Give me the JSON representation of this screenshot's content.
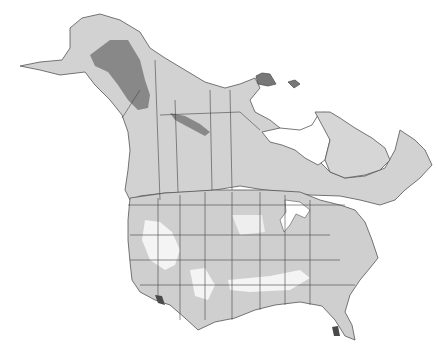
{
  "map": {
    "title": "",
    "region": "North America (Canada, Alaska, United States)",
    "colors": {
      "background": "#ffffff",
      "zone_lightest": "#f4f4f4",
      "zone_light": "#dcdcdc",
      "zone_mid": "#c4c4c4",
      "zone_dark": "#8a8a8a",
      "zone_darkest": "#4a4a4a",
      "border": "#444444"
    },
    "zones": [
      {
        "name": "zone-1",
        "shade": "darkest"
      },
      {
        "name": "zone-2",
        "shade": "dark"
      },
      {
        "name": "zone-3",
        "shade": "mid"
      },
      {
        "name": "zone-4",
        "shade": "light"
      },
      {
        "name": "zone-5",
        "shade": "lightest"
      }
    ]
  }
}
